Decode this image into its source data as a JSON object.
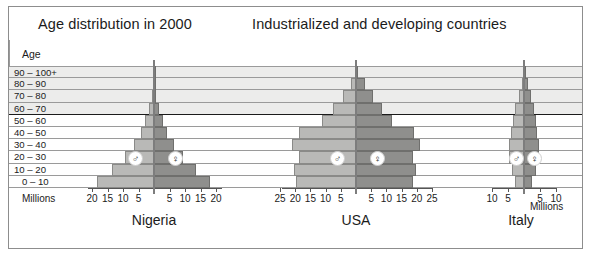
{
  "titles": {
    "left": "Age distribution in 2000",
    "right": "Industrialized and developing countries"
  },
  "age_axis_label": "Age",
  "age_bands": [
    "90 – 100+",
    "80 – 90",
    "70 – 80",
    "60 – 70",
    "50 – 60",
    "40 – 50",
    "30 – 40",
    "20 – 30",
    "10 – 20",
    "0 – 10"
  ],
  "legend": {
    "male_symbol": "♂",
    "female_symbol": "♀"
  },
  "unit_label": "Millions",
  "colors": {
    "male_fill": "#b9b9b7",
    "female_fill": "#8f8f8d",
    "band_shade": "#ececeb",
    "grid": "#9a9a9a",
    "divider": "#1b1b1b"
  },
  "chart_data": {
    "type": "bar",
    "subtype": "population-pyramid",
    "ylabel": "Age",
    "xlabel": "Millions",
    "categories": [
      "90 – 100+",
      "80 – 90",
      "70 – 80",
      "60 – 70",
      "50 – 60",
      "40 – 50",
      "30 – 40",
      "20 – 30",
      "10 – 20",
      "0 – 10"
    ],
    "grid": true,
    "legend_position": "inline",
    "divider_after_band": "60 – 70",
    "panels": [
      {
        "name": "Nigeria",
        "xlim": [
          0,
          20
        ],
        "ticks": [
          5,
          10,
          15,
          20
        ],
        "tick_labels_left": [
          "20",
          "15",
          "10",
          "5"
        ],
        "tick_labels_right": [
          "5",
          "10",
          "15",
          "20"
        ],
        "unit_side": "left",
        "series": [
          {
            "name": "♂",
            "values": [
              0.1,
              0.3,
              0.8,
              1.7,
              2.8,
              4.2,
              6.3,
              9.3,
              13.6,
              18.5
            ]
          },
          {
            "name": "♀",
            "values": [
              0.1,
              0.3,
              0.8,
              1.7,
              2.8,
              4.2,
              6.3,
              9.3,
              13.6,
              18.2
            ]
          }
        ]
      },
      {
        "name": "USA",
        "xlim": [
          0,
          25
        ],
        "ticks": [
          5,
          10,
          15,
          20,
          25
        ],
        "tick_labels_left": [
          "25",
          "20",
          "15",
          "10",
          "5"
        ],
        "tick_labels_right": [
          "5",
          "10",
          "15",
          "20",
          "25"
        ],
        "unit_side": "none",
        "series": [
          {
            "name": "♂",
            "values": [
              0.3,
              1.7,
              4.3,
              7.6,
              11.2,
              18.6,
              21.0,
              18.9,
              20.3,
              19.8
            ]
          },
          {
            "name": "♀",
            "values": [
              0.8,
              2.8,
              5.6,
              8.6,
              11.8,
              19.1,
              21.2,
              18.7,
              19.6,
              18.9
            ]
          }
        ]
      },
      {
        "name": "Italy",
        "xlim": [
          0,
          10
        ],
        "ticks": [
          5,
          10
        ],
        "tick_labels_left": [
          "10",
          "5"
        ],
        "tick_labels_right": [
          "5",
          "10"
        ],
        "unit_side": "right",
        "series": [
          {
            "name": "♂",
            "values": [
              0.1,
              0.7,
              1.6,
              2.7,
              3.5,
              4.1,
              4.6,
              4.7,
              3.8,
              2.8
            ]
          },
          {
            "name": "♀",
            "values": [
              0.3,
              1.3,
              2.2,
              3.0,
              3.7,
              4.2,
              4.6,
              4.6,
              3.6,
              2.6
            ]
          }
        ]
      }
    ]
  }
}
